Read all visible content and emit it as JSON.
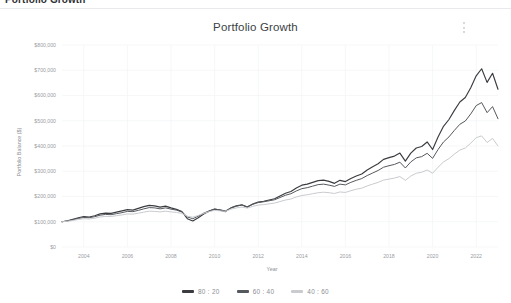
{
  "page_header": {
    "title": "Portfolio Growth"
  },
  "card": {
    "menu_icon": "kebab-menu-icon"
  },
  "chart_data": {
    "type": "line",
    "title": "Portfolio Growth",
    "xlabel": "Year",
    "ylabel": "Portfolio Balance ($)",
    "grid": true,
    "legend_position": "bottom",
    "xlim": [
      2003,
      2023
    ],
    "ylim": [
      0,
      800000
    ],
    "xticks": [
      2004,
      2006,
      2008,
      2010,
      2012,
      2014,
      2016,
      2018,
      2020,
      2022
    ],
    "xticklabels": [
      "2004",
      "2006",
      "2008",
      "2010",
      "2012",
      "2014",
      "2016",
      "2018",
      "2020",
      "2022"
    ],
    "yticks": [
      0,
      100000,
      200000,
      300000,
      400000,
      500000,
      600000,
      700000,
      800000
    ],
    "yticklabels": [
      "$0",
      "$100,000",
      "$200,000",
      "$300,000",
      "$400,000",
      "$500,000",
      "$600,000",
      "$700,000",
      "$800,000"
    ],
    "x": [
      2003.0,
      2003.25,
      2003.5,
      2003.75,
      2004.0,
      2004.25,
      2004.5,
      2004.75,
      2005.0,
      2005.25,
      2005.5,
      2005.75,
      2006.0,
      2006.25,
      2006.5,
      2006.75,
      2007.0,
      2007.25,
      2007.5,
      2007.75,
      2008.0,
      2008.25,
      2008.5,
      2008.75,
      2009.0,
      2009.25,
      2009.5,
      2009.75,
      2010.0,
      2010.25,
      2010.5,
      2010.75,
      2011.0,
      2011.25,
      2011.5,
      2011.75,
      2012.0,
      2012.25,
      2012.5,
      2012.75,
      2013.0,
      2013.25,
      2013.5,
      2013.75,
      2014.0,
      2014.25,
      2014.5,
      2014.75,
      2015.0,
      2015.25,
      2015.5,
      2015.75,
      2016.0,
      2016.25,
      2016.5,
      2016.75,
      2017.0,
      2017.25,
      2017.5,
      2017.75,
      2018.0,
      2018.25,
      2018.5,
      2018.75,
      2019.0,
      2019.25,
      2019.5,
      2019.75,
      2020.0,
      2020.25,
      2020.5,
      2020.75,
      2021.0,
      2021.25,
      2021.5,
      2021.75,
      2022.0,
      2022.25,
      2022.5,
      2022.75,
      2023.0
    ],
    "series": [
      {
        "name": "80 : 20",
        "color": "#3a3c40",
        "width": 1.15,
        "values": [
          100000,
          104000,
          110000,
          116000,
          121000,
          119000,
          124000,
          131000,
          134000,
          133000,
          138000,
          143000,
          148000,
          146000,
          153000,
          160000,
          165000,
          163000,
          158000,
          162000,
          155000,
          149000,
          140000,
          112000,
          103000,
          116000,
          131000,
          142000,
          150000,
          146000,
          140000,
          155000,
          163000,
          167000,
          158000,
          170000,
          178000,
          181000,
          186000,
          191000,
          202000,
          213000,
          220000,
          234000,
          245000,
          249000,
          256000,
          263000,
          265000,
          260000,
          252000,
          264000,
          259000,
          271000,
          281000,
          289000,
          305000,
          318000,
          330000,
          347000,
          354000,
          360000,
          372000,
          340000,
          372000,
          392000,
          398000,
          416000,
          386000,
          436000,
          478000,
          505000,
          541000,
          574000,
          592000,
          631000,
          678000,
          706000,
          652000,
          688000,
          625000
        ]
      },
      {
        "name": "60 : 40",
        "color": "#55585d",
        "width": 1.0,
        "values": [
          100000,
          103000,
          108000,
          113000,
          117000,
          116000,
          120000,
          126000,
          129000,
          128000,
          132000,
          136000,
          141000,
          140000,
          145000,
          151000,
          156000,
          155000,
          151000,
          155000,
          150000,
          146000,
          139000,
          119000,
          112000,
          122000,
          134000,
          143000,
          150000,
          147000,
          143000,
          155000,
          162000,
          166000,
          159000,
          169000,
          176000,
          179000,
          183000,
          187000,
          196000,
          205000,
          211000,
          222000,
          231000,
          235000,
          241000,
          247000,
          249000,
          245000,
          240000,
          249000,
          246000,
          256000,
          264000,
          271000,
          283000,
          293000,
          303000,
          316000,
          322000,
          327000,
          336000,
          313000,
          337000,
          353000,
          358000,
          371000,
          351000,
          386000,
          416000,
          436000,
          462000,
          486000,
          499000,
          527000,
          560000,
          572000,
          532000,
          556000,
          508000
        ]
      },
      {
        "name": "40 : 60",
        "color": "#c9cbcf",
        "width": 1.0,
        "values": [
          100000,
          102000,
          105000,
          109000,
          112000,
          111000,
          114000,
          119000,
          121000,
          121000,
          124000,
          127000,
          131000,
          130000,
          134000,
          138000,
          142000,
          141000,
          139000,
          142000,
          139000,
          137000,
          133000,
          122000,
          118000,
          125000,
          133000,
          140000,
          145000,
          143000,
          141000,
          150000,
          155000,
          158000,
          154000,
          161000,
          166000,
          168000,
          171000,
          174000,
          180000,
          186000,
          190000,
          198000,
          204000,
          207000,
          211000,
          215000,
          217000,
          215000,
          212000,
          218000,
          216000,
          223000,
          229000,
          233000,
          242000,
          249000,
          256000,
          265000,
          269000,
          273000,
          279000,
          264000,
          281000,
          292000,
          296000,
          305000,
          292000,
          316000,
          337000,
          350000,
          368000,
          384000,
          392000,
          411000,
          433000,
          440000,
          414000,
          430000,
          400000
        ]
      }
    ]
  },
  "legend": {
    "items": [
      {
        "label": "80 : 20",
        "color": "#3a3c40"
      },
      {
        "label": "60 : 40",
        "color": "#55585d"
      },
      {
        "label": "40 : 60",
        "color": "#c9cbcf"
      }
    ]
  }
}
